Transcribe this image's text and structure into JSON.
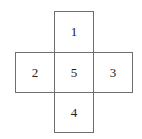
{
  "diagram": {
    "type": "cube-net-cross",
    "cells": [
      {
        "label": "1",
        "position": "top"
      },
      {
        "label": "2",
        "position": "left"
      },
      {
        "label": "5",
        "position": "center"
      },
      {
        "label": "3",
        "position": "right"
      },
      {
        "label": "4",
        "position": "bottom"
      }
    ]
  }
}
